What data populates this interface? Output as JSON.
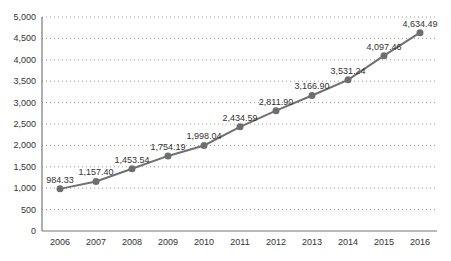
{
  "chart_data": {
    "type": "line",
    "title": "",
    "xlabel": "",
    "ylabel": "",
    "categories": [
      "2006",
      "2007",
      "2008",
      "2009",
      "2010",
      "2011",
      "2012",
      "2013",
      "2014",
      "2015",
      "2016"
    ],
    "series": [
      {
        "name": "",
        "values": [
          984.33,
          1157.4,
          1453.54,
          1754.19,
          1998.04,
          2434.59,
          2811.9,
          3166.9,
          3531.24,
          4097.46,
          4634.49
        ],
        "labels": [
          "984.33",
          "1,157.40",
          "1,453.54",
          "1,754.19",
          "1,998.04",
          "2,434.59",
          "2,811.90",
          "3,166.90",
          "3,531.24",
          "4,097.46",
          "4,634.49"
        ],
        "color": "#707070"
      }
    ],
    "ylim": [
      0,
      5000
    ],
    "yticks": [
      0,
      500,
      1000,
      1500,
      2000,
      2500,
      3000,
      3500,
      4000,
      4500,
      5000
    ],
    "ytick_labels": [
      "0",
      "500",
      "1,000",
      "1,500",
      "2,000",
      "2,500",
      "3,000",
      "3,500",
      "4,000",
      "4,500",
      "5,000"
    ],
    "grid": true,
    "legend": "none"
  }
}
